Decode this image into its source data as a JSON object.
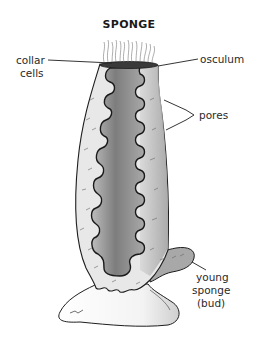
{
  "diagram": {
    "title": "SPONGE",
    "labels": {
      "collar_cells": [
        "collar",
        "cells"
      ],
      "osculum": "osculum",
      "pores": "pores",
      "young_sponge": [
        "young",
        "sponge",
        "(bud)"
      ]
    },
    "colors": {
      "outline": "#1e1e1e",
      "outer_body": "#e6e6e6",
      "inner_cavity_dark": "#8a8a8a",
      "inner_cavity_light": "#cfcfcf",
      "right_wall": "#b0b0b0",
      "rock": "#f4f4f4"
    }
  }
}
